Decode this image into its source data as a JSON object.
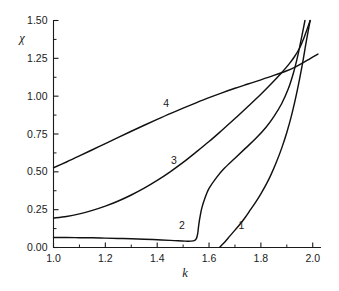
{
  "chart_data": {
    "type": "line",
    "title": "",
    "xlabel": "k",
    "ylabel": "χ",
    "xlim": [
      1.0,
      2.03
    ],
    "ylim": [
      0.0,
      1.5
    ],
    "grid": false,
    "legend_position": "inline-curve-labels",
    "x_ticks": [
      "1.0",
      "1.2",
      "1.4",
      "1.6",
      "1.8",
      "2.0"
    ],
    "x_tick_values": [
      1.0,
      1.2,
      1.4,
      1.6,
      1.8,
      2.0
    ],
    "x_minor_tick_values": [
      1.1,
      1.3,
      1.5,
      1.7,
      1.9
    ],
    "y_ticks": [
      "0.00",
      "0.25",
      "0.50",
      "0.75",
      "1.00",
      "1.25",
      "1.50"
    ],
    "y_tick_values": [
      0.0,
      0.25,
      0.5,
      0.75,
      1.0,
      1.25,
      1.5
    ],
    "y_minor_tick_values": [
      0.125,
      0.375,
      0.625,
      0.875,
      1.125,
      1.375
    ],
    "annotations": [
      {
        "label": "1",
        "x": 1.725,
        "y": 0.125
      },
      {
        "label": "2",
        "x": 1.495,
        "y": 0.125
      },
      {
        "label": "3",
        "x": 1.465,
        "y": 0.555
      },
      {
        "label": "4",
        "x": 1.435,
        "y": 0.93
      }
    ],
    "series": [
      {
        "name": "1",
        "label": "1",
        "color": "#111111",
        "points": [
          [
            1.64,
            0.0
          ],
          [
            1.66,
            0.035
          ],
          [
            1.68,
            0.075
          ],
          [
            1.7,
            0.115
          ],
          [
            1.72,
            0.155
          ],
          [
            1.74,
            0.2
          ],
          [
            1.76,
            0.25
          ],
          [
            1.78,
            0.3
          ],
          [
            1.8,
            0.355
          ],
          [
            1.82,
            0.415
          ],
          [
            1.84,
            0.485
          ],
          [
            1.86,
            0.565
          ],
          [
            1.88,
            0.655
          ],
          [
            1.9,
            0.76
          ],
          [
            1.92,
            0.885
          ],
          [
            1.94,
            1.035
          ],
          [
            1.96,
            1.21
          ],
          [
            1.975,
            1.36
          ],
          [
            1.99,
            1.5
          ]
        ]
      },
      {
        "name": "2",
        "label": "2",
        "color": "#111111",
        "points": [
          [
            1.0,
            0.066
          ],
          [
            1.05,
            0.066
          ],
          [
            1.1,
            0.065
          ],
          [
            1.15,
            0.064
          ],
          [
            1.2,
            0.062
          ],
          [
            1.25,
            0.06
          ],
          [
            1.3,
            0.058
          ],
          [
            1.35,
            0.055
          ],
          [
            1.4,
            0.051
          ],
          [
            1.45,
            0.047
          ],
          [
            1.48,
            0.044
          ],
          [
            1.51,
            0.042
          ],
          [
            1.53,
            0.042
          ],
          [
            1.545,
            0.047
          ],
          [
            1.552,
            0.062
          ],
          [
            1.556,
            0.09
          ],
          [
            1.558,
            0.115
          ],
          [
            1.56,
            0.145
          ],
          [
            1.565,
            0.2
          ],
          [
            1.572,
            0.26
          ],
          [
            1.585,
            0.33
          ],
          [
            1.6,
            0.39
          ],
          [
            1.63,
            0.465
          ],
          [
            1.66,
            0.525
          ],
          [
            1.7,
            0.59
          ],
          [
            1.74,
            0.655
          ],
          [
            1.78,
            0.72
          ],
          [
            1.82,
            0.795
          ],
          [
            1.85,
            0.865
          ],
          [
            1.88,
            0.95
          ],
          [
            1.905,
            1.045
          ],
          [
            1.925,
            1.15
          ],
          [
            1.94,
            1.25
          ],
          [
            1.952,
            1.345
          ],
          [
            1.962,
            1.43
          ],
          [
            1.97,
            1.5
          ]
        ]
      },
      {
        "name": "3",
        "label": "3",
        "color": "#111111",
        "points": [
          [
            1.0,
            0.195
          ],
          [
            1.05,
            0.205
          ],
          [
            1.1,
            0.222
          ],
          [
            1.15,
            0.245
          ],
          [
            1.2,
            0.273
          ],
          [
            1.25,
            0.307
          ],
          [
            1.3,
            0.347
          ],
          [
            1.35,
            0.392
          ],
          [
            1.4,
            0.443
          ],
          [
            1.45,
            0.5
          ],
          [
            1.5,
            0.562
          ],
          [
            1.55,
            0.63
          ],
          [
            1.6,
            0.7
          ],
          [
            1.65,
            0.775
          ],
          [
            1.7,
            0.852
          ],
          [
            1.75,
            0.932
          ],
          [
            1.8,
            1.013
          ],
          [
            1.84,
            1.082
          ],
          [
            1.88,
            1.155
          ],
          [
            1.91,
            1.215
          ],
          [
            1.93,
            1.262
          ],
          [
            1.95,
            1.32
          ],
          [
            1.965,
            1.38
          ],
          [
            1.978,
            1.44
          ],
          [
            1.99,
            1.5
          ]
        ]
      },
      {
        "name": "4",
        "label": "4",
        "color": "#111111",
        "points": [
          [
            1.0,
            0.527
          ],
          [
            1.05,
            0.565
          ],
          [
            1.1,
            0.605
          ],
          [
            1.15,
            0.646
          ],
          [
            1.2,
            0.687
          ],
          [
            1.25,
            0.728
          ],
          [
            1.3,
            0.768
          ],
          [
            1.35,
            0.808
          ],
          [
            1.4,
            0.847
          ],
          [
            1.45,
            0.885
          ],
          [
            1.5,
            0.921
          ],
          [
            1.55,
            0.956
          ],
          [
            1.6,
            0.99
          ],
          [
            1.65,
            1.022
          ],
          [
            1.7,
            1.052
          ],
          [
            1.75,
            1.08
          ],
          [
            1.8,
            1.108
          ],
          [
            1.85,
            1.137
          ],
          [
            1.9,
            1.168
          ],
          [
            1.93,
            1.19
          ],
          [
            1.96,
            1.218
          ],
          [
            1.99,
            1.248
          ],
          [
            2.02,
            1.278
          ]
        ]
      }
    ]
  }
}
